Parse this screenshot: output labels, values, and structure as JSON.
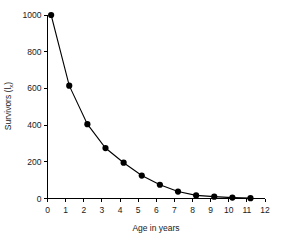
{
  "figure": {
    "background_color": "#ffffff",
    "ink_color": "#000000"
  },
  "chart_data": {
    "type": "line",
    "title": "",
    "subtitle": "",
    "xlabel": "Age in years",
    "ylabel": "Survivors (lx)",
    "ylabel_parts": {
      "text": "Survivors (l",
      "sub": "x",
      "close": ")"
    },
    "x": [
      0,
      1,
      2,
      3,
      4,
      5,
      6,
      7,
      8,
      9,
      10,
      11
    ],
    "values": [
      1000,
      615,
      405,
      275,
      195,
      125,
      75,
      38,
      17,
      10,
      5,
      2
    ],
    "series": [
      {
        "name": "Survivors",
        "values": [
          1000,
          615,
          405,
          275,
          195,
          125,
          75,
          38,
          17,
          10,
          5,
          2
        ]
      }
    ],
    "point_x_offset": 0.2,
    "xlim": [
      0,
      12
    ],
    "ylim": [
      0,
      1000
    ],
    "xticks": [
      0,
      1,
      2,
      3,
      4,
      5,
      6,
      7,
      8,
      9,
      10,
      11,
      12
    ],
    "xticklabels": [
      "0",
      "1",
      "2",
      "3",
      "4",
      "5",
      "6",
      "7",
      "8",
      "9",
      "10",
      "11",
      "12"
    ],
    "yticks": [
      0,
      200,
      400,
      600,
      800,
      1000
    ],
    "yticklabels": [
      "0",
      "200",
      "400",
      "600",
      "800",
      "1000"
    ],
    "grid": false,
    "legend": false,
    "legend_position": "none",
    "marker": "filled-circle",
    "marker_size": 3.1,
    "line_style": "solid",
    "annotations": []
  }
}
